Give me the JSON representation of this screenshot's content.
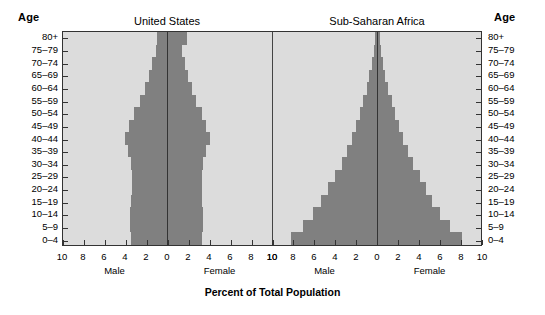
{
  "axis_header_left": "Age",
  "axis_header_right": "Age",
  "axis_title": "Percent of Total Population",
  "sex_labels": {
    "male": "Male",
    "female": "Female"
  },
  "colors": {
    "bar": "#808080",
    "plot_background": "#dcdcdc",
    "axis": "#333333",
    "page_background": "#ffffff"
  },
  "chart_data": {
    "type": "bar",
    "title": "Percent of Total Population",
    "subtype": "population-pyramid",
    "xlabel": "Percent of Total Population",
    "ylabel": "Age",
    "xlim": [
      -10,
      10
    ],
    "xticks": [
      10,
      8,
      6,
      4,
      2,
      0,
      2,
      4,
      6,
      8,
      10
    ],
    "grid": false,
    "legend": "none",
    "categories": [
      "0–4",
      "5–9",
      "10–14",
      "15–19",
      "20–24",
      "25–29",
      "30–34",
      "35–39",
      "40–44",
      "45–49",
      "50–54",
      "55–59",
      "60–64",
      "65–69",
      "70–74",
      "75–79",
      "80+"
    ],
    "panels": [
      {
        "title": "United States",
        "series": [
          {
            "name": "Male",
            "values": [
              3.5,
              3.6,
              3.6,
              3.5,
              3.4,
              3.4,
              3.5,
              3.8,
              4.1,
              3.7,
              3.2,
              2.6,
              2.2,
              1.8,
              1.5,
              1.1,
              1.0
            ]
          },
          {
            "name": "Female",
            "values": [
              3.3,
              3.4,
              3.4,
              3.3,
              3.3,
              3.3,
              3.4,
              3.7,
              4.1,
              3.7,
              3.3,
              2.7,
              2.3,
              2.0,
              1.7,
              1.4,
              1.9
            ]
          }
        ]
      },
      {
        "title": "Sub-Saharan Africa",
        "series": [
          {
            "name": "Male",
            "values": [
              8.3,
              7.1,
              6.2,
              5.4,
              4.7,
              4.0,
              3.4,
              2.9,
              2.4,
              2.0,
              1.6,
              1.3,
              1.0,
              0.8,
              0.5,
              0.3,
              0.2
            ]
          },
          {
            "name": "Female",
            "values": [
              8.2,
              7.0,
              6.1,
              5.3,
              4.7,
              4.1,
              3.5,
              3.0,
              2.5,
              2.1,
              1.7,
              1.4,
              1.1,
              0.8,
              0.6,
              0.4,
              0.3
            ]
          }
        ]
      }
    ]
  }
}
